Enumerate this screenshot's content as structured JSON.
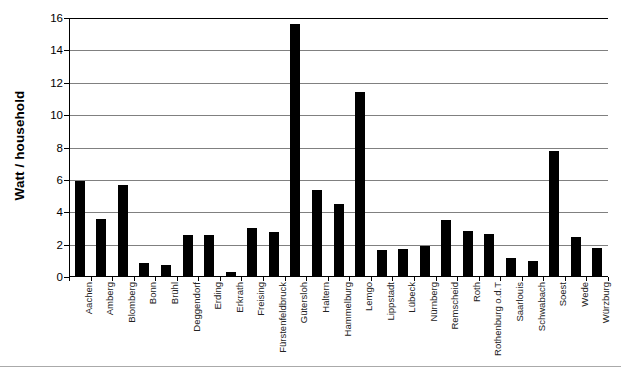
{
  "chart": {
    "type": "bar",
    "title": "",
    "ylabel": "Watt / household",
    "xlabel": ""
  },
  "chart_data": {
    "type": "bar",
    "title": "",
    "xlabel": "",
    "ylabel": "Watt / household",
    "ylim": [
      0,
      16
    ],
    "ytick_values": [
      0,
      2,
      4,
      6,
      8,
      10,
      12,
      14,
      16
    ],
    "ytick_labels": [
      "0",
      "2",
      "4",
      "6",
      "8",
      "10",
      "12",
      "14",
      "16"
    ],
    "grid": "horizontal",
    "legend": "none",
    "bar_color": "#000000",
    "categories": [
      "Aachen",
      "Amberg",
      "Blomberg",
      "Bonn",
      "Brühl",
      "Deggendorf",
      "Erding",
      "Erkrath",
      "Freising",
      "Fürstenfeldbruck",
      "Gütersloh",
      "Haltern",
      "Hammelburg",
      "Lemgo",
      "Lippstadt",
      "Lübeck",
      "Nürnberg",
      "Remscheid",
      "Roth",
      "Rothenburg o.d.T",
      "Saarlouis",
      "Schwabach",
      "Soest",
      "Wede",
      "Würzburg"
    ],
    "values": [
      5.95,
      3.6,
      5.7,
      0.85,
      0.75,
      2.6,
      2.6,
      0.3,
      3.05,
      2.75,
      15.6,
      5.4,
      4.5,
      11.4,
      1.65,
      1.75,
      1.9,
      3.5,
      2.85,
      2.65,
      1.15,
      1.0,
      7.8,
      2.45,
      1.8
    ]
  }
}
